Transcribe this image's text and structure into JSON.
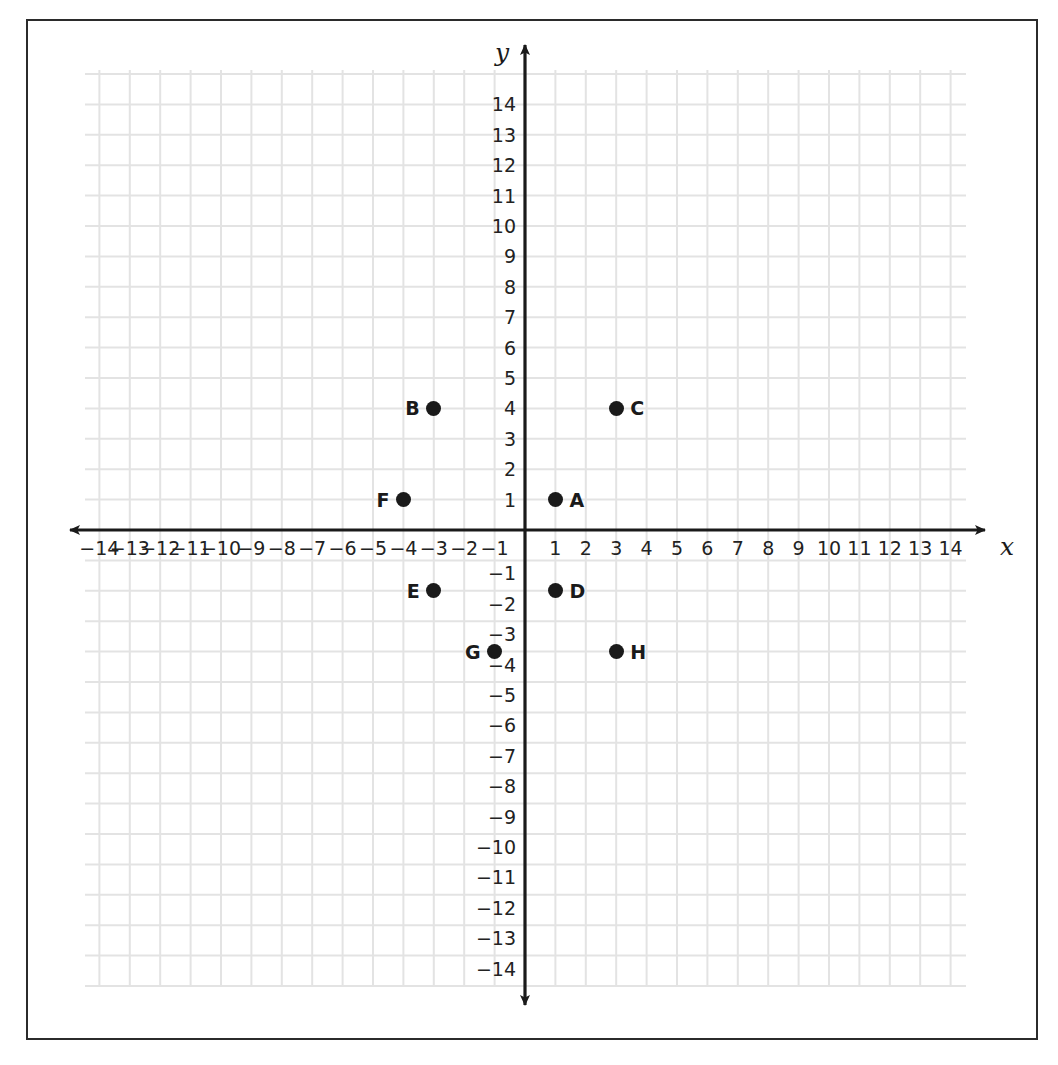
{
  "figure": {
    "kind": "coordinate-plane",
    "background_color": "#ffffff",
    "border_color": "#2b2b2b",
    "grid_color": "#e3e3e3",
    "axis_color": "#1a1a1a",
    "point_color": "#1a1a1a"
  },
  "axes": {
    "x_label": "x",
    "y_label": "y",
    "x_ticks": [
      "-14",
      "-13",
      "-12",
      "-11",
      "-10",
      "-9",
      "-8",
      "-7",
      "-6",
      "-5",
      "-4",
      "-3",
      "-2",
      "-1",
      "1",
      "2",
      "3",
      "4",
      "5",
      "6",
      "7",
      "8",
      "9",
      "10",
      "11",
      "12",
      "13",
      "14"
    ],
    "y_ticks": [
      "14",
      "13",
      "12",
      "11",
      "10",
      "9",
      "8",
      "7",
      "6",
      "5",
      "4",
      "3",
      "2",
      "1",
      "-1",
      "-2",
      "-3",
      "-4",
      "-5",
      "-6",
      "-7",
      "-8",
      "-9",
      "-10",
      "-11",
      "-12",
      "-13",
      "-14"
    ],
    "x_arrow_both_ends": true,
    "y_arrow_both_ends": true
  },
  "chart_data": {
    "type": "scatter",
    "title": "",
    "xlabel": "x",
    "ylabel": "y",
    "xlim": [
      -14.7,
      14.7
    ],
    "ylim": [
      -15.3,
      15.3
    ],
    "grid": true,
    "grid_step": 1,
    "legend": "none",
    "point_labels": [
      "A",
      "B",
      "C",
      "D",
      "E",
      "F",
      "G",
      "H"
    ],
    "x": [
      1,
      -3,
      3,
      1,
      -3,
      -4,
      -1,
      3
    ],
    "y": [
      1,
      4,
      4,
      -2,
      -2,
      1,
      -4,
      -4
    ],
    "points": [
      {
        "label": "A",
        "x": 1,
        "y": 1,
        "label_side": "right"
      },
      {
        "label": "B",
        "x": -3,
        "y": 4,
        "label_side": "left"
      },
      {
        "label": "C",
        "x": 3,
        "y": 4,
        "label_side": "right"
      },
      {
        "label": "D",
        "x": 1,
        "y": -2,
        "label_side": "right"
      },
      {
        "label": "E",
        "x": -3,
        "y": -2,
        "label_side": "left"
      },
      {
        "label": "F",
        "x": -4,
        "y": 1,
        "label_side": "left"
      },
      {
        "label": "G",
        "x": -1,
        "y": -4,
        "label_side": "left"
      },
      {
        "label": "H",
        "x": 3,
        "y": -4,
        "label_side": "right"
      }
    ]
  }
}
